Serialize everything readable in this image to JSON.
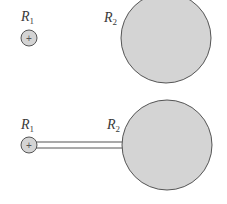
{
  "figure": {
    "panels": [
      {
        "id": "separated",
        "small_sphere": {
          "label": "R",
          "subscript": "1",
          "charge_symbol": "+",
          "cx": 29,
          "cy": 38,
          "r": 8
        },
        "large_sphere": {
          "label": "R",
          "subscript": "2",
          "cx": 166,
          "cy": 38,
          "r": 45
        },
        "connected": false
      },
      {
        "id": "connected",
        "small_sphere": {
          "label": "R",
          "subscript": "1",
          "charge_symbol": "+",
          "cx": 29,
          "cy": 145,
          "r": 8
        },
        "large_sphere": {
          "label": "R",
          "subscript": "2",
          "cx": 167,
          "cy": 145,
          "r": 45
        },
        "connected": true,
        "wire": {
          "x1": 37,
          "x2": 122,
          "y_top": 142,
          "y_bottom": 148
        }
      }
    ]
  },
  "colors": {
    "sphere_fill": "#d4d4d4",
    "sphere_stroke": "#555555",
    "wire_stroke": "#555555",
    "label_color": "#3a3a3a"
  }
}
